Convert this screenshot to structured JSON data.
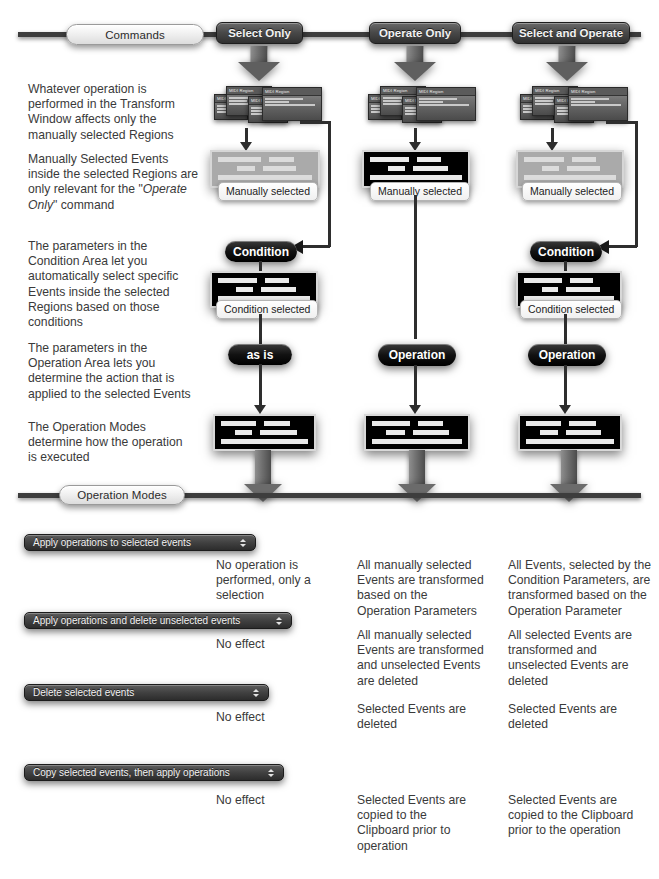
{
  "diagram": {
    "accent_dark": "#2e2e2e",
    "accent_light": "#ededed"
  },
  "rails": {
    "commands_label": "Commands",
    "operation_modes_label": "Operation Modes"
  },
  "commands": [
    {
      "label": "Select Only"
    },
    {
      "label": "Operate Only"
    },
    {
      "label": "Select and Operate"
    }
  ],
  "notes": [
    {
      "text": "Whatever operation is\nperformed in the Transform\nWindow affects only the\nmanually selected Regions"
    },
    {
      "text": "Manually Selected Events\ninside the selected Regions are\nonly relevant for the \"Operate\nOnly\" command"
    },
    {
      "text": "The parameters in the\nCondition Area let you\nautomatically select specific\nEvents inside the selected\nRegions based on those\nconditions"
    },
    {
      "text": "The parameters in the\nOperation Area lets you\ndetermine the action that is\napplied to the selected Events"
    },
    {
      "text": "The Operation Modes\ndetermine how the operation\nis executed"
    }
  ],
  "region_title": "MIDI Region",
  "columns": [
    {
      "key": "select_only",
      "manual_caption": "Manually selected",
      "manual_state": "dimmed",
      "condition_label": "Condition",
      "condition_caption": "Condition selected",
      "operation_label": "as is",
      "has_bypass_arrow": true
    },
    {
      "key": "operate_only",
      "manual_caption": "Manually selected",
      "manual_state": "active",
      "condition_label": null,
      "condition_caption": null,
      "operation_label": "Operation",
      "has_bypass_arrow": false
    },
    {
      "key": "select_and_operate",
      "manual_caption": "Manually selected",
      "manual_state": "dimmed",
      "condition_label": "Condition",
      "condition_caption": "Condition selected",
      "operation_label": "Operation",
      "has_bypass_arrow": true
    }
  ],
  "modes": [
    {
      "select_label": "Apply operations to selected events",
      "result_select_only": "No operation is\nperformed, only a\nselection",
      "result_operate_only": "All manually selected\nEvents are transformed\nbased on the\nOperation Parameters",
      "result_select_and_operate": "All Events, selected by the\nCondition Parameters, are\ntransformed based on the\nOperation Parameter"
    },
    {
      "select_label": "Apply operations and delete unselected events",
      "result_select_only": "No effect",
      "result_operate_only": "All manually selected\nEvents are transformed\nand unselected Events\nare deleted",
      "result_select_and_operate": "All selected Events are\ntransformed and\nunselected Events are\ndeleted"
    },
    {
      "select_label": "Delete selected events",
      "result_select_only": "No effect",
      "result_operate_only": "Selected Events are\ndeleted",
      "result_select_and_operate": "Selected Events are\ndeleted"
    },
    {
      "select_label": "Copy selected events, then apply operations",
      "result_select_only": "No effect",
      "result_operate_only": "Selected Events are\ncopied to the\nClipboard prior to\noperation",
      "result_select_and_operate": "Selected Events are\ncopied to the Clipboard\nprior to the operation"
    }
  ]
}
